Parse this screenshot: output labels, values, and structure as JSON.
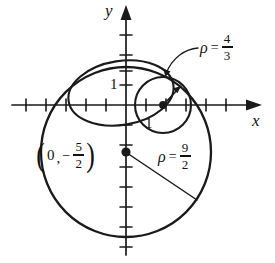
{
  "figure": {
    "axes": {
      "x_label": "x",
      "y_label": "y",
      "x_tick_label": "",
      "y_tick_label": "1",
      "second_tick_label": "1",
      "origin_px": [
        126,
        105
      ],
      "unit_px": 20,
      "x_ticks": [
        -5,
        -4,
        -3,
        -2,
        -1,
        1,
        2,
        3,
        4,
        5
      ],
      "y_ticks": [
        -6,
        -5,
        -4,
        -3,
        -2,
        -1,
        1,
        2,
        3
      ],
      "axis_color": "#1a1a1a"
    },
    "labels": {
      "small_circle": {
        "symbol": "ρ",
        "equals": "=",
        "numerator": "4",
        "denominator": "3",
        "text": "ρ = 4/3"
      },
      "big_circle": {
        "symbol": "ρ",
        "equals": "=",
        "numerator": "9",
        "denominator": "2",
        "text": "ρ = 9/2"
      },
      "center_point": {
        "open_paren": "(",
        "zero": "0",
        "comma": ",",
        "minus": "−",
        "numerator": "5",
        "denominator": "2",
        "close_paren": ")",
        "text": "(0, −5/2)"
      }
    },
    "curves": [
      {
        "name": "big-circle",
        "type": "circle",
        "center": [
          0,
          -2.5
        ],
        "radius": 4.5,
        "radius_label": "ρ = 9/2",
        "stroke": "#1a1a1a",
        "stroke_width": 2.2
      },
      {
        "name": "medium-ellipse",
        "type": "ellipse",
        "center": [
          -0.2,
          0.62
        ],
        "rx": 2.62,
        "ry": 1.62,
        "rotation_deg": -8,
        "stroke": "#1a1a1a",
        "stroke_width": 2.0
      },
      {
        "name": "small-circle",
        "type": "circle",
        "center": [
          1.85,
          0
        ],
        "radius": 1.3333,
        "radius_label": "ρ = 4/3",
        "stroke": "#1a1a1a",
        "stroke_width": 2.0
      }
    ],
    "points": [
      {
        "name": "big-circle-center",
        "coords": [
          0,
          -2.5
        ],
        "label": "(0, −5/2)"
      },
      {
        "name": "small-circle-center",
        "coords": [
          1.85,
          0
        ],
        "label": ""
      }
    ],
    "colors": {
      "ink": "#1a1a1a",
      "background": "#ffffff"
    }
  }
}
